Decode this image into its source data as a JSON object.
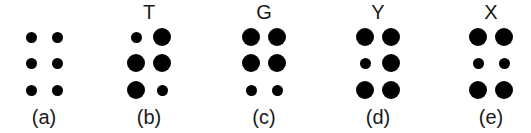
{
  "figure": {
    "cells": [
      {
        "id": "a",
        "caption": "(a)",
        "letter": "",
        "center_x": 44,
        "dots": [
          [
            "small",
            "small"
          ],
          [
            "small",
            "small"
          ],
          [
            "small",
            "small"
          ]
        ]
      },
      {
        "id": "b",
        "caption": "(b)",
        "letter": "T",
        "center_x": 149,
        "dots": [
          [
            "small",
            "big"
          ],
          [
            "big",
            "big"
          ],
          [
            "big",
            "small"
          ]
        ]
      },
      {
        "id": "c",
        "caption": "(c)",
        "letter": "G",
        "center_x": 264,
        "dots": [
          [
            "big",
            "big"
          ],
          [
            "big",
            "big"
          ],
          [
            "small",
            "small"
          ]
        ]
      },
      {
        "id": "d",
        "caption": "(d)",
        "letter": "Y",
        "center_x": 378,
        "dots": [
          [
            "big",
            "big"
          ],
          [
            "small",
            "big"
          ],
          [
            "big",
            "big"
          ]
        ]
      },
      {
        "id": "e",
        "caption": "(e)",
        "letter": "X",
        "center_x": 491,
        "dots": [
          [
            "big",
            "big"
          ],
          [
            "small",
            "small"
          ],
          [
            "big",
            "big"
          ]
        ]
      }
    ],
    "layout": {
      "column_offset": 13,
      "row_y": [
        37,
        63,
        90
      ],
      "dot_color": "#000000",
      "background": "#ffffff"
    }
  }
}
